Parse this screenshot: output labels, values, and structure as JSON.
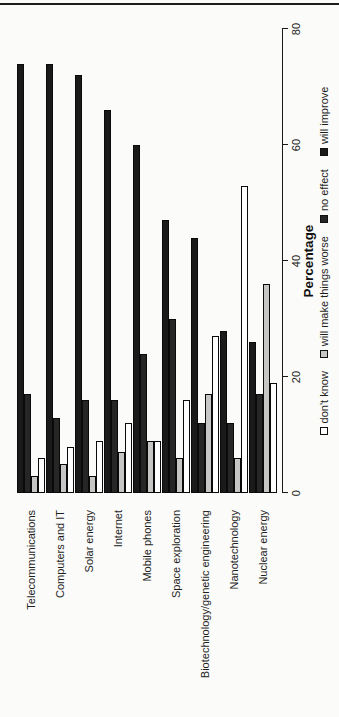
{
  "page": {
    "background_color": "#fbfbf9",
    "top_rule_color": "#1c1c1c",
    "rotation_note": "chart is printed rotated 90 degrees counter-clockwise on a portrait page"
  },
  "chart_data": {
    "type": "bar",
    "orientation": "horizontal grouped bars (as read after rotating page clockwise)",
    "title": "",
    "xlabel": "Percentage",
    "ylabel": "",
    "xlim": [
      0,
      80
    ],
    "x_ticks": [
      0,
      20,
      40,
      60,
      80
    ],
    "grid": "off",
    "categories": [
      "Telecommunications",
      "Computers and IT",
      "Solar energy",
      "Internet",
      "Mobile phones",
      "Space exploration",
      "Biotechnology/genetic engineering",
      "Nanotechnology",
      "Nuclear energy"
    ],
    "bar_order_top_to_bottom_within_group": [
      "will improve",
      "no effect",
      "will make things worse",
      "don't know"
    ],
    "series": [
      {
        "name": "will improve",
        "color": "#1a1a1a",
        "border": "#0a0a0a",
        "values": [
          74,
          74,
          72,
          66,
          60,
          47,
          44,
          28,
          26
        ]
      },
      {
        "name": "no effect",
        "color": "#262626",
        "border": "#0a0a0a",
        "values": [
          17,
          13,
          16,
          16,
          24,
          30,
          12,
          12,
          17
        ]
      },
      {
        "name": "will make things worse",
        "color": "#c6c6c4",
        "border": "#0a0a0a",
        "values": [
          3,
          5,
          3,
          7,
          9,
          6,
          17,
          6,
          36
        ]
      },
      {
        "name": "don't know",
        "color": "#ffffff",
        "border": "#0a0a0a",
        "values": [
          6,
          8,
          9,
          12,
          9,
          16,
          27,
          53,
          19
        ]
      }
    ],
    "legend": {
      "position": "bottom",
      "entries_left_to_right": [
        "don't know",
        "will make things worse",
        "no effect",
        "will improve"
      ]
    }
  }
}
